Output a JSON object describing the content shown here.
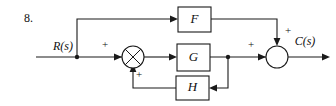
{
  "figure": {
    "problem_number": "8.",
    "type": "control-system-block-diagram",
    "title": "",
    "line_color": "#1a1a1a",
    "background": "#ffffff"
  },
  "io": {
    "input_label": "R(s)",
    "output_label": "C(s)"
  },
  "blocks": [
    {
      "id": "F",
      "label": "F",
      "x": 178,
      "y": 7,
      "w": 33,
      "h": 25
    },
    {
      "id": "G",
      "label": "G",
      "x": 177,
      "y": 44,
      "w": 33,
      "h": 27
    },
    {
      "id": "H",
      "label": "H",
      "x": 176,
      "y": 76,
      "w": 33,
      "h": 24
    }
  ],
  "summing_junctions": [
    {
      "id": "sum1",
      "style": "crossed-circle",
      "cx": 133,
      "cy": 57,
      "r": 11,
      "signs": [
        {
          "label": "+",
          "port": "left"
        },
        {
          "label": "+",
          "port": "bottom"
        }
      ]
    },
    {
      "id": "sum2",
      "style": "plain-circle",
      "cx": 277,
      "cy": 57,
      "r": 11,
      "signs": [
        {
          "label": "+",
          "port": "left"
        },
        {
          "label": "+",
          "port": "top"
        }
      ]
    }
  ],
  "signs": {
    "sum1_left": "+",
    "sum1_bottom": "+",
    "sum2_left": "+",
    "sum2_top": "+"
  },
  "branch_points": [
    {
      "id": "r-branch",
      "cx": 77,
      "cy": 57,
      "feeds": [
        "F",
        "sum1"
      ]
    },
    {
      "id": "g-branch",
      "cx": 228,
      "cy": 57,
      "feeds": [
        "sum2",
        "H"
      ]
    }
  ],
  "connections": [
    {
      "from": "R(s)",
      "to": "r-branch"
    },
    {
      "from": "r-branch",
      "to": "F",
      "path": "up-over-right"
    },
    {
      "from": "r-branch",
      "to": "sum1",
      "sign": "+"
    },
    {
      "from": "sum1",
      "to": "G"
    },
    {
      "from": "G",
      "to": "g-branch"
    },
    {
      "from": "g-branch",
      "to": "sum2",
      "sign": "+"
    },
    {
      "from": "g-branch",
      "to": "H",
      "path": "down-left"
    },
    {
      "from": "H",
      "to": "sum1",
      "sign": "+",
      "path": "left-up"
    },
    {
      "from": "F",
      "to": "sum2",
      "sign": "+",
      "path": "right-down"
    },
    {
      "from": "sum2",
      "to": "C(s)"
    }
  ]
}
